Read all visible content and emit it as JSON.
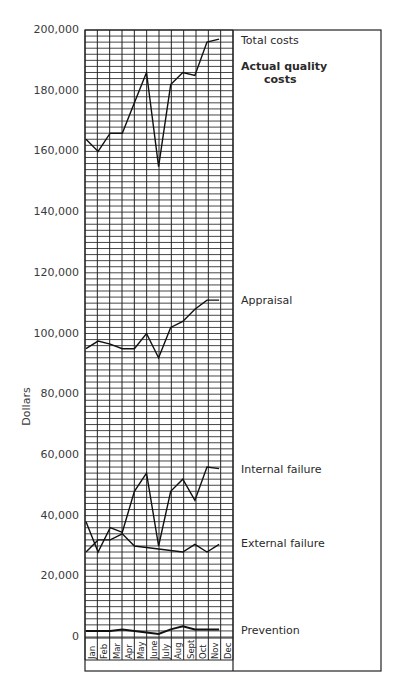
{
  "chart_data": {
    "type": "line",
    "title": "",
    "annotation": "Actual quality costs",
    "xlabel": "",
    "ylabel": "Dollars",
    "ylim": [
      0,
      200000
    ],
    "yticks": [
      "0",
      "20,000",
      "40,000",
      "60,000",
      "80,000",
      "100,000",
      "120,000",
      "140,000",
      "160,000",
      "180,000",
      "200,000"
    ],
    "grid": true,
    "legend_position": "right (inline labels)",
    "categories": [
      "Jan",
      "Feb",
      "Mar",
      "Apr",
      "May",
      "June",
      "July",
      "Aug",
      "Sept",
      "Oct",
      "Nov",
      "Dec"
    ],
    "series": [
      {
        "name": "Total costs",
        "values": [
          164000,
          160000,
          166000,
          166000,
          176000,
          186000,
          155000,
          182000,
          186000,
          185000,
          196000,
          197000
        ]
      },
      {
        "name": "Appraisal",
        "values": [
          95000,
          97500,
          96500,
          95000,
          95000,
          100000,
          92000,
          102000,
          104000,
          108000,
          111000,
          111000
        ]
      },
      {
        "name": "Internal failure",
        "values": [
          38000,
          28000,
          36000,
          34500,
          48000,
          54000,
          30000,
          48000,
          52000,
          45000,
          56000,
          55500
        ]
      },
      {
        "name": "External failure",
        "values": [
          28000,
          32000,
          32000,
          34000,
          30000,
          29500,
          29000,
          28500,
          28000,
          30500,
          28000,
          30500
        ]
      },
      {
        "name": "Prevention",
        "values": [
          2000,
          2000,
          2000,
          2500,
          2000,
          1500,
          1000,
          2500,
          3500,
          2500,
          2500,
          2500
        ]
      }
    ]
  },
  "labels": {
    "total": "Total costs",
    "actual_1": "Actual quality",
    "actual_2": "costs",
    "appraisal": "Appraisal",
    "internal": "Internal failure",
    "external": "External failure",
    "prevention": "Prevention"
  }
}
